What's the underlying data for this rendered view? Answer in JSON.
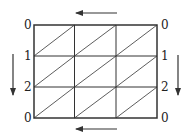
{
  "diagram": {
    "type": "triangulated grid",
    "grid": {
      "columns": 3,
      "rows": 3,
      "diagonal_direction": "bottom-left to top-right"
    },
    "left_labels": [
      "0",
      "1",
      "2",
      "0"
    ],
    "right_labels": [
      "0",
      "1",
      "2",
      "0"
    ],
    "arrows": {
      "top": "left",
      "bottom": "left",
      "left": "down",
      "right": "down"
    },
    "colors": {
      "line": "#333333",
      "background": "#ffffff"
    }
  }
}
